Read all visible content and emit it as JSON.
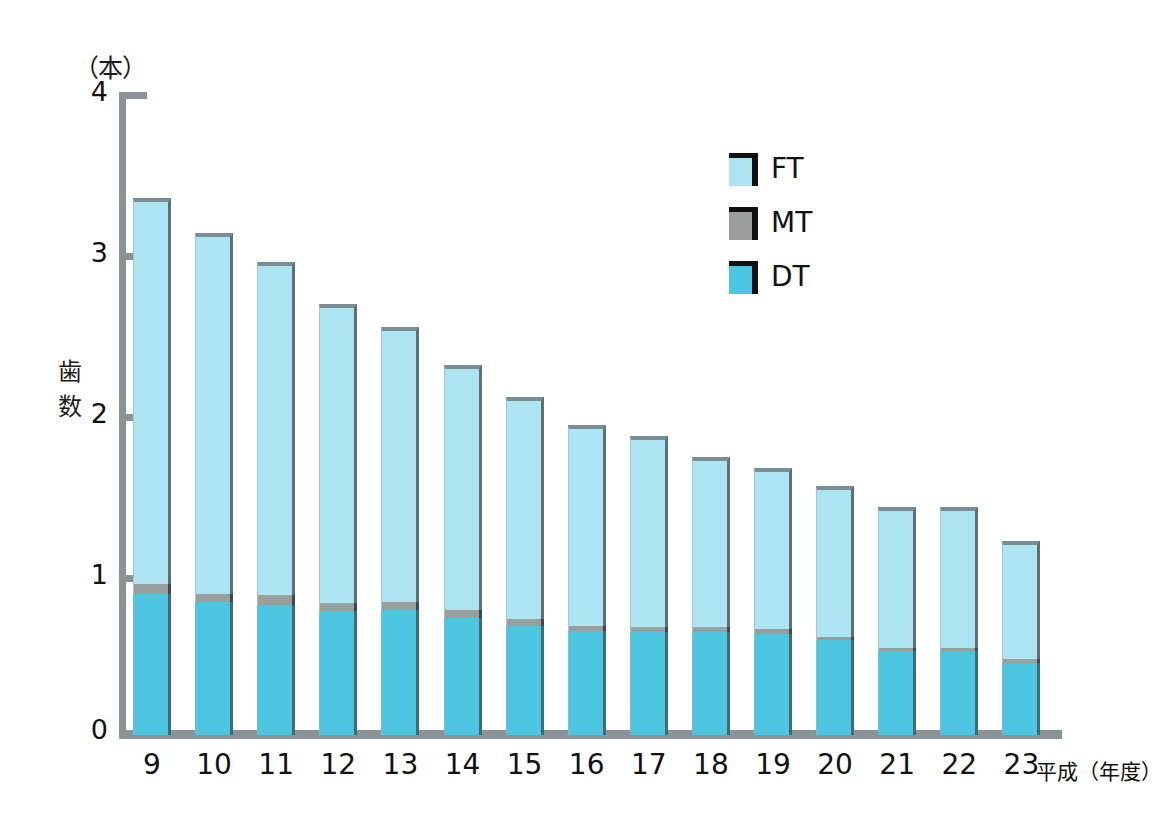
{
  "chart_data": {
    "type": "bar",
    "stacked": true,
    "title": "",
    "subtitle": "",
    "xlabel": "平成（年度）",
    "ylabel": "歯数",
    "yunit": "（本）",
    "ylim": [
      0,
      4
    ],
    "yticks": [
      "0",
      "1",
      "2",
      "3",
      "4"
    ],
    "grid": false,
    "legend_position": "top-right",
    "categories": [
      "9",
      "10",
      "11",
      "12",
      "13",
      "14",
      "15",
      "16",
      "17",
      "18",
      "19",
      "20",
      "21",
      "22",
      "23"
    ],
    "series": [
      {
        "name": "DT",
        "color": "#4cc5e0",
        "values": [
          0.88,
          0.83,
          0.81,
          0.77,
          0.78,
          0.73,
          0.68,
          0.65,
          0.64,
          0.64,
          0.63,
          0.59,
          0.52,
          0.52,
          0.45
        ]
      },
      {
        "name": "MT",
        "color": "#9a9e9d",
        "values": [
          0.06,
          0.05,
          0.06,
          0.05,
          0.05,
          0.05,
          0.04,
          0.03,
          0.03,
          0.03,
          0.03,
          0.02,
          0.02,
          0.02,
          0.02
        ]
      },
      {
        "name": "FT",
        "color": "#ade4f2",
        "values": [
          2.4,
          2.24,
          2.07,
          1.86,
          1.71,
          1.52,
          1.38,
          1.25,
          1.19,
          1.06,
          1.0,
          0.94,
          0.88,
          0.88,
          0.74
        ]
      }
    ],
    "totals": [
      3.34,
      3.12,
      2.94,
      2.68,
      2.54,
      2.3,
      2.1,
      1.93,
      1.86,
      1.73,
      1.66,
      1.55,
      1.42,
      1.42,
      1.21
    ]
  },
  "legend": {
    "items": [
      {
        "label": "FT",
        "color": "#ade4f2"
      },
      {
        "label": "MT",
        "color": "#9a9e9d"
      },
      {
        "label": "DT",
        "color": "#4cc5e0"
      }
    ]
  },
  "axis": {
    "unit": "（本）",
    "y_title_chars": [
      "歯",
      "数"
    ],
    "x_note": "平成（年度）",
    "tick_0": "0",
    "tick_1": "1",
    "tick_2": "2",
    "tick_3": "3",
    "tick_4": "4"
  },
  "colors": {
    "ft": "#ade4f2",
    "mt": "#9a9e9d",
    "dt": "#4cc5e0",
    "axis": "#8c9396",
    "text": "#111111",
    "background": "#ffffff"
  }
}
